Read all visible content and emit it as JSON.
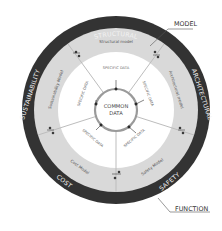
{
  "diagram": {
    "center_label": [
      "COMMON",
      "DATA"
    ],
    "outer_ring": {
      "labels": [
        "STRUCTURAL",
        "ARCHITECTURAL",
        "SAFETY",
        "COST",
        "SUSTAINABILITY"
      ],
      "color": "#333333"
    },
    "model_ring": {
      "labels": [
        "Structural model",
        "Architectural model",
        "Safety Model",
        "Cost Model",
        "Sustainability Model"
      ],
      "color": "#d9d9d9"
    },
    "inner_ring": {
      "labels": [
        "SPECIFIC DATA",
        "SPECIFIC DATA",
        "SPECIFIC DATA",
        "SPECIFIC DATA",
        "SPECIFIC DATA"
      ],
      "color": "#ffffff"
    },
    "callouts": {
      "model": "MODEL",
      "function": "FUNCTION"
    }
  }
}
